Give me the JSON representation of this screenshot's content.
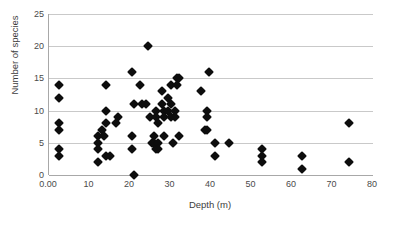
{
  "chart_data": {
    "type": "scatter",
    "title": "",
    "xlabel": "Depth (m)",
    "ylabel": "Number of species",
    "xlim": [
      0,
      80
    ],
    "ylim": [
      0,
      25
    ],
    "xticks": [
      "0.00",
      "10",
      "20",
      "30",
      "40",
      "50",
      "60",
      "70",
      "80"
    ],
    "xtick_values": [
      0,
      10,
      20,
      30,
      40,
      50,
      60,
      70,
      80
    ],
    "yticks": [
      "0",
      "5",
      "10",
      "15",
      "20",
      "25"
    ],
    "ytick_values": [
      0,
      5,
      10,
      15,
      20,
      25
    ],
    "grid": "horizontal",
    "legend": "none",
    "marker": "diamond",
    "marker_color": "#0d0d0d",
    "series": [
      {
        "name": "Species richness vs depth",
        "points": [
          [
            2.5,
            14
          ],
          [
            2.5,
            12
          ],
          [
            2.5,
            8
          ],
          [
            2.5,
            7
          ],
          [
            2.5,
            4
          ],
          [
            2.5,
            3
          ],
          [
            12.0,
            6
          ],
          [
            12.0,
            5
          ],
          [
            12.0,
            4
          ],
          [
            12.0,
            2
          ],
          [
            13.0,
            7
          ],
          [
            13.5,
            6
          ],
          [
            14.0,
            14
          ],
          [
            14.0,
            10
          ],
          [
            14.0,
            8
          ],
          [
            14.0,
            3
          ],
          [
            15.0,
            3
          ],
          [
            16.5,
            8
          ],
          [
            17.0,
            9
          ],
          [
            20.5,
            16
          ],
          [
            20.5,
            6
          ],
          [
            20.5,
            4
          ],
          [
            21.0,
            0
          ],
          [
            21.0,
            11
          ],
          [
            22.5,
            14
          ],
          [
            23.0,
            11
          ],
          [
            24.0,
            11
          ],
          [
            24.5,
            20
          ],
          [
            25.0,
            9
          ],
          [
            25.5,
            5
          ],
          [
            26.0,
            6
          ],
          [
            26.0,
            5
          ],
          [
            26.5,
            4
          ],
          [
            26.5,
            10
          ],
          [
            26.5,
            9
          ],
          [
            27.0,
            8
          ],
          [
            27.0,
            5
          ],
          [
            27.0,
            4
          ],
          [
            28.0,
            13
          ],
          [
            28.0,
            11
          ],
          [
            28.5,
            10
          ],
          [
            28.5,
            9
          ],
          [
            28.5,
            6
          ],
          [
            29.5,
            12
          ],
          [
            29.5,
            10
          ],
          [
            30.0,
            14
          ],
          [
            30.0,
            11
          ],
          [
            30.0,
            9
          ],
          [
            30.5,
            5
          ],
          [
            31.0,
            10
          ],
          [
            31.0,
            9
          ],
          [
            31.5,
            15
          ],
          [
            31.5,
            14
          ],
          [
            32.0,
            15
          ],
          [
            32.0,
            6
          ],
          [
            37.5,
            13
          ],
          [
            38.5,
            7
          ],
          [
            39.0,
            7
          ],
          [
            39.0,
            10
          ],
          [
            39.0,
            9
          ],
          [
            39.5,
            16
          ],
          [
            41.0,
            5
          ],
          [
            41.0,
            3
          ],
          [
            44.5,
            5
          ],
          [
            52.5,
            4
          ],
          [
            52.5,
            3
          ],
          [
            52.5,
            2
          ],
          [
            62.5,
            3
          ],
          [
            62.5,
            1
          ],
          [
            74.0,
            8
          ],
          [
            74.0,
            2
          ]
        ]
      }
    ]
  }
}
